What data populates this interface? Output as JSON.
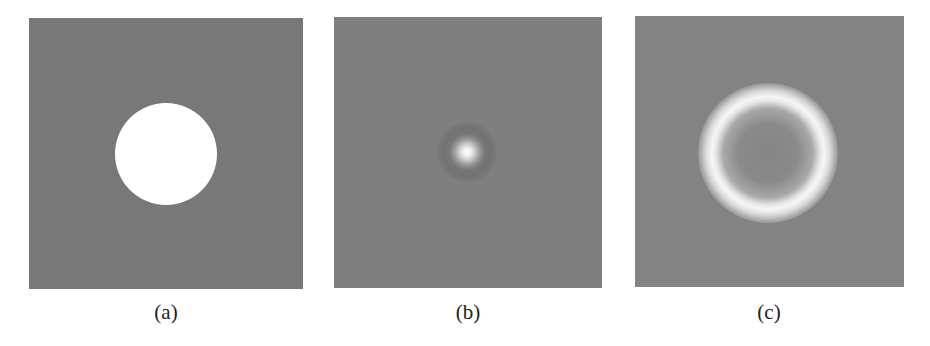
{
  "figure": {
    "panels": [
      {
        "id": "a",
        "caption": "(a)",
        "description": "uniform white disk on gray background",
        "background": "#787878",
        "feature_color": "#ffffff"
      },
      {
        "id": "b",
        "caption": "(b)",
        "description": "small bright blurred spot with faint dark halo on gray background",
        "background": "#7f7f7f",
        "feature_color": "#ffffff"
      },
      {
        "id": "c",
        "caption": "(c)",
        "description": "bright ring surrounded by dark ring on gray background",
        "background": "#838383",
        "feature_color": "#f6f6f6",
        "dark_ring_color": "#151515"
      }
    ]
  }
}
